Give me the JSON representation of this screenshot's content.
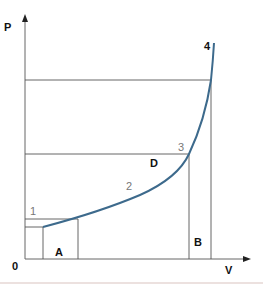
{
  "diagram": {
    "axes": {
      "y_label": "P",
      "x_label": "V",
      "origin_label": "0"
    },
    "points": [
      {
        "label": "1",
        "style": "thin"
      },
      {
        "label": "2",
        "style": "thin"
      },
      {
        "label": "3",
        "style": "thin"
      },
      {
        "label": "4",
        "style": "bold"
      }
    ],
    "regions": [
      {
        "label": "A"
      },
      {
        "label": "B"
      },
      {
        "label": "D"
      }
    ],
    "colors": {
      "curve": "#3d6a8c",
      "axis": "#666666",
      "guide": "#555555",
      "label": "#111111",
      "thin_label": "#777777"
    }
  }
}
